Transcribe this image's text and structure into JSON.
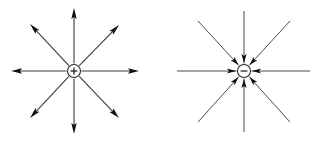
{
  "figure": {
    "background_color": "#ffffff",
    "width": 316,
    "height": 141,
    "line_color": "#3a3a3a",
    "arrow_color": "#111111",
    "charge_outline_color": "#2a2a2a"
  },
  "diagrams": [
    {
      "id": "positive-charge",
      "label": "positive point charge",
      "charge_sign": "+",
      "charge_symbol_name": "plus-sign",
      "field_direction": "outward",
      "arrow_placement": "line-ends",
      "center": {
        "x": 74,
        "y": 71
      },
      "circle_radius": 6.5,
      "line_count": 8,
      "line_angles_deg": [
        0,
        45,
        90,
        135,
        180,
        225,
        270,
        315
      ],
      "line_tips": [
        {
          "name": "field-line-right",
          "angle_deg": 0,
          "tip_x": 139,
          "tip_y": 71
        },
        {
          "name": "field-line-upper-right",
          "angle_deg": 45,
          "tip_x": 119,
          "tip_y": 25
        },
        {
          "name": "field-line-up",
          "angle_deg": 90,
          "tip_x": 74,
          "tip_y": 8
        },
        {
          "name": "field-line-upper-left",
          "angle_deg": 135,
          "tip_x": 30,
          "tip_y": 24
        },
        {
          "name": "field-line-left",
          "angle_deg": 180,
          "tip_x": 11,
          "tip_y": 71
        },
        {
          "name": "field-line-lower-left",
          "angle_deg": 225,
          "tip_x": 30,
          "tip_y": 118
        },
        {
          "name": "field-line-down",
          "angle_deg": 270,
          "tip_x": 74,
          "tip_y": 134
        },
        {
          "name": "field-line-lower-right",
          "angle_deg": 315,
          "tip_x": 119,
          "tip_y": 118
        }
      ]
    },
    {
      "id": "negative-charge",
      "label": "negative point charge",
      "charge_sign": "−",
      "charge_symbol_name": "minus-sign",
      "field_direction": "inward",
      "arrow_placement": "near-center",
      "center": {
        "x": 244,
        "y": 71
      },
      "circle_radius": 6.5,
      "line_count": 8,
      "line_angles_deg": [
        0,
        45,
        90,
        135,
        180,
        225,
        270,
        315
      ],
      "line_tips": [
        {
          "name": "field-line-right",
          "angle_deg": 0,
          "tip_x": 310,
          "tip_y": 71
        },
        {
          "name": "field-line-upper-right",
          "angle_deg": 45,
          "tip_x": 290,
          "tip_y": 21
        },
        {
          "name": "field-line-up",
          "angle_deg": 90,
          "tip_x": 244,
          "tip_y": 11
        },
        {
          "name": "field-line-upper-left",
          "angle_deg": 135,
          "tip_x": 198,
          "tip_y": 21
        },
        {
          "name": "field-line-left",
          "angle_deg": 180,
          "tip_x": 177,
          "tip_y": 71
        },
        {
          "name": "field-line-lower-left",
          "angle_deg": 225,
          "tip_x": 198,
          "tip_y": 122
        },
        {
          "name": "field-line-down",
          "angle_deg": 270,
          "tip_x": 244,
          "tip_y": 132
        },
        {
          "name": "field-line-lower-right",
          "angle_deg": 315,
          "tip_x": 290,
          "tip_y": 122
        }
      ],
      "inward_arrow_distance": 14
    }
  ]
}
